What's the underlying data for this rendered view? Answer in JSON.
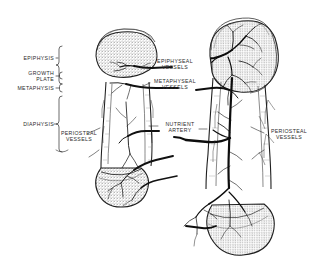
{
  "figure": {
    "background_color": "#ffffff",
    "ink_color": "#1a1a1a"
  },
  "labels": {
    "left_regions": [
      {
        "id": "epiphysis",
        "text": "EPIPHYSIS",
        "x": 10,
        "y": 56,
        "align": "right",
        "width": 44
      },
      {
        "id": "growth_plate_line1",
        "text": "GROWTH",
        "x": 10,
        "y": 72,
        "align": "right",
        "width": 44
      },
      {
        "id": "growth_plate_line2",
        "text": "PLATE",
        "x": 10,
        "y": 78,
        "align": "right",
        "width": 44
      },
      {
        "id": "metaphysis",
        "text": "METAPHYSIS",
        "x": 6,
        "y": 87,
        "align": "right",
        "width": 48
      },
      {
        "id": "diaphysis",
        "text": "DIAPHYSIS",
        "x": 10,
        "y": 122,
        "align": "right",
        "width": 44
      }
    ],
    "left_vessels": {
      "id": "periosteal_vessels_left",
      "line1": "PERIOSTEAL",
      "line2": "VESSELS",
      "x": 56,
      "y": 130
    },
    "center_vessels": [
      {
        "id": "epiphyseal_vessels",
        "line1": "EPIPHYSEAL",
        "line2": "VESSELS",
        "x": 152,
        "y": 59
      },
      {
        "id": "metaphyseal_vessels",
        "line1": "METAPHYSEAL",
        "line2": "VESSELS",
        "x": 148,
        "y": 79
      }
    ],
    "center_artery": {
      "id": "nutrient_artery",
      "line1": "NUTRIENT",
      "line2": "ARTERY",
      "x": 160,
      "y": 122
    },
    "right_vessels": {
      "id": "periosteal_vessels_right",
      "line1": "PERIOSTEAL",
      "line2": "VESSELS",
      "x": 265,
      "y": 128
    }
  }
}
